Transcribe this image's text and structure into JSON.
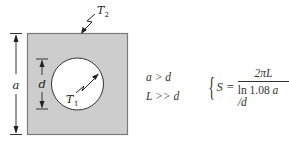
{
  "diagram": {
    "type": "conduction shape factor",
    "square": {
      "fill": "#cdcdcd",
      "border": "#7a7a7a",
      "outer_temperature_label": "T",
      "outer_temperature_sub": "2"
    },
    "circle": {
      "fill": "#ffffff",
      "inner_temperature_label": "T",
      "inner_temperature_sub": "1"
    },
    "dimensions": {
      "outer_label": "a",
      "inner_label": "d"
    }
  },
  "conditions": {
    "line1": "a > d",
    "line2": "L >> d"
  },
  "formula": {
    "lhs": "S",
    "equals": "=",
    "numerator": "2πL",
    "denominator_fn": "ln",
    "denominator_const": "1.08",
    "denominator_var": "a /d",
    "brace": "{"
  }
}
